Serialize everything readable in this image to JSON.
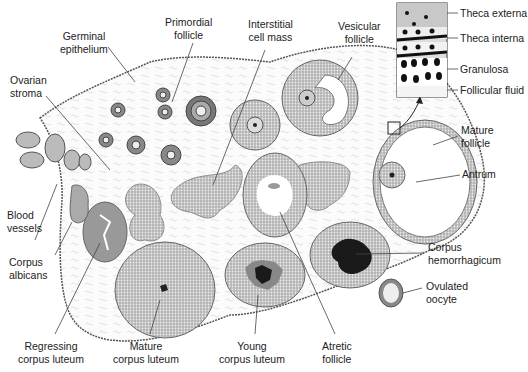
{
  "figure": {
    "labels": {
      "germinal_epithelium": [
        "Germinal",
        "epithelium"
      ],
      "primordial_follicle": [
        "Primordial",
        "follicle"
      ],
      "interstitial_cell_mass": [
        "Interstitial",
        "cell mass"
      ],
      "vesicular_follicle": [
        "Vesicular",
        "follicle"
      ],
      "ovarian_stroma": [
        "Ovarian",
        "stroma"
      ],
      "blood_vessels": [
        "Blood",
        "vessels"
      ],
      "corpus_albicans": [
        "Corpus",
        "albicans"
      ],
      "regressing_corpus_luteum": [
        "Regressing",
        "corpus luteum"
      ],
      "mature_corpus_luteum": [
        "Mature",
        "corpus luteum"
      ],
      "young_corpus_luteum": [
        "Young",
        "corpus luteum"
      ],
      "atretic_follicle": [
        "Atretic",
        "follicle"
      ],
      "corpus_hemorrhagicum": [
        "Corpus",
        "hemorrhagicum"
      ],
      "ovulated_oocyte": [
        "Ovulated",
        "oocyte"
      ],
      "mature_follicle": [
        "Mature",
        "follicle"
      ],
      "antrum": [
        "Antrum"
      ]
    },
    "inset": {
      "labels": [
        "Theca externa",
        "Theca interna",
        "Granulosa",
        "Follicular fluid"
      ]
    },
    "colors": {
      "line": "#333333",
      "tissue_fill": "#9a9a9a",
      "dark_fill": "#1a1a1a",
      "stroma": "#f4f4f4"
    }
  }
}
